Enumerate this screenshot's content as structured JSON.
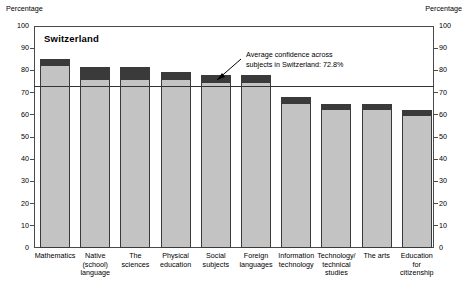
{
  "axis_caption_left": "Percentage",
  "axis_caption_right": "Percentage",
  "country_title": "Switzerland",
  "annotation": {
    "text": "Average confidence across\nsubjects in Switzerland: 72.8%",
    "value": 72.8
  },
  "chart_data": {
    "type": "bar",
    "title": "Switzerland",
    "xlabel": "",
    "ylabel": "Percentage",
    "ylim": [
      0,
      100
    ],
    "yticks": [
      0,
      10,
      20,
      30,
      40,
      50,
      60,
      70,
      80,
      90,
      100
    ],
    "ytick_labels": [
      "0",
      "10",
      "20",
      "30",
      "40",
      "50",
      "60",
      "70",
      "80",
      "90",
      "100"
    ],
    "grid": false,
    "legend": "none",
    "stacked": true,
    "categories": [
      "Mathematics",
      "Native\n(school)\nlanguage",
      "The sciences",
      "Physical\neducation",
      "Social\nsubjects",
      "Foreign\nlanguages",
      "Information\ntechnology",
      "Technology/\ntechnical\nstudies",
      "The arts",
      "Education\nfor\ncitizenship"
    ],
    "series": [
      {
        "name": "lower-segment",
        "color": "#c3c3c3",
        "values": [
          81.5,
          75.0,
          75.0,
          75.0,
          74.0,
          74.0,
          64.5,
          61.5,
          61.5,
          59.0
        ]
      },
      {
        "name": "upper-segment",
        "color": "#3a3a3a",
        "values": [
          3.8,
          6.4,
          6.4,
          4.4,
          4.0,
          4.0,
          3.5,
          3.5,
          3.5,
          3.0
        ]
      }
    ],
    "totals": [
      85.3,
      81.4,
      81.4,
      79.4,
      78.0,
      78.0,
      68.0,
      65.0,
      65.0,
      62.0
    ],
    "reference_line": {
      "label": "Average confidence across subjects in Switzerland: 72.8%",
      "value": 72.8
    }
  }
}
